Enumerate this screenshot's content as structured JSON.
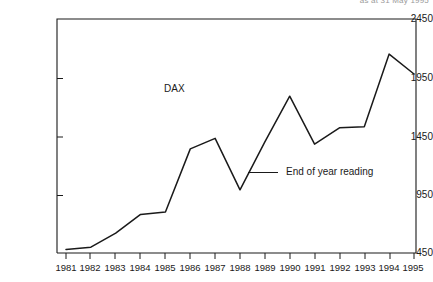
{
  "header": {
    "caption": "as at 31 May 1995"
  },
  "annotation": {
    "series_label": "DAX"
  },
  "legend": {
    "position": "inside-right",
    "entries": [
      {
        "label": "End of year reading",
        "marker": "line",
        "color": "#1a1a1a"
      }
    ]
  },
  "axes": {
    "y_ticks": [
      "450",
      "950",
      "1450",
      "1950",
      "2450"
    ],
    "x_ticks": [
      "1981",
      "1982",
      "1983",
      "1984",
      "1985",
      "1986",
      "1987",
      "1988",
      "1989",
      "1990",
      "1991",
      "1992",
      "1993",
      "1994",
      "1995"
    ]
  },
  "colors": {
    "line": "#1a1a1a",
    "frame": "#1a1a1a",
    "background": "#ffffff"
  },
  "chart_data": {
    "type": "line",
    "title": "",
    "subtitle": "",
    "xlabel": "",
    "ylabel": "",
    "xlim": [
      1981,
      1995
    ],
    "ylim": [
      450,
      2450
    ],
    "y_ticks": [
      450,
      950,
      1450,
      1950,
      2450
    ],
    "grid": false,
    "legend_position": "inside-right",
    "annotations": [
      {
        "text": "DAX",
        "x": 1985,
        "y": 1560
      }
    ],
    "categories": [
      1981,
      1982,
      1983,
      1984,
      1985,
      1986,
      1987,
      1988,
      1989,
      1990,
      1991,
      1992,
      1993,
      1994,
      1995
    ],
    "series": [
      {
        "name": "End of year reading",
        "color": "#1a1a1a",
        "values": [
          480,
          500,
          620,
          780,
          800,
          1340,
          1430,
          990,
          1400,
          1790,
          1380,
          1520,
          1530,
          2150,
          1980
        ]
      }
    ]
  }
}
